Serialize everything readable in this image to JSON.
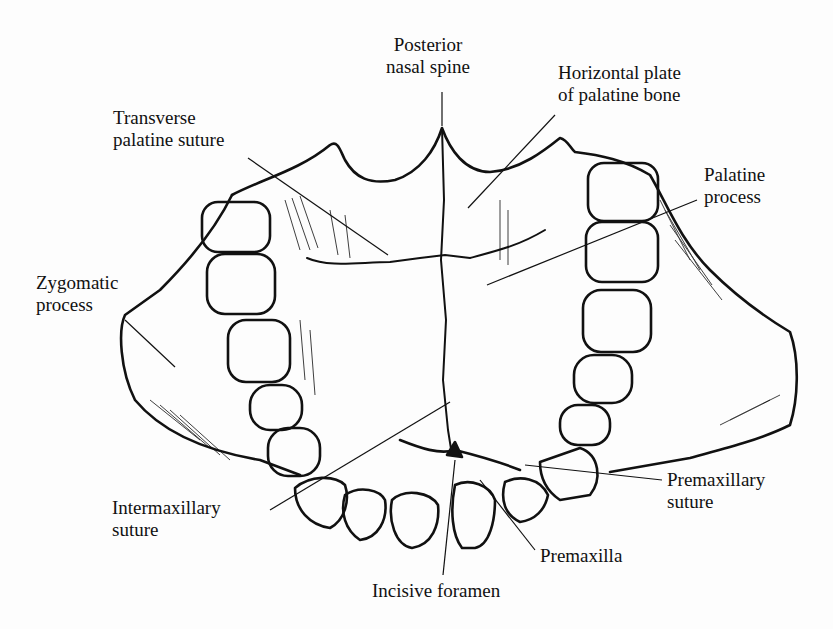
{
  "figure": {
    "labels": {
      "posterior_nasal_spine": [
        "Posterior",
        "nasal spine"
      ],
      "horizontal_plate": [
        "Horizontal plate",
        "of palatine bone"
      ],
      "transverse_palatine_suture": [
        "Transverse",
        "palatine suture"
      ],
      "palatine_process": [
        "Palatine",
        "process"
      ],
      "zygomatic_process": [
        "Zygomatic",
        "process"
      ],
      "intermaxillary_suture": [
        "Intermaxillary",
        "suture"
      ],
      "premaxillary_suture": [
        "Premaxillary",
        "suture"
      ],
      "premaxilla": [
        "Premaxilla"
      ],
      "incisive_foramen": [
        "Incisive foramen"
      ]
    },
    "colors": {
      "ink": "#111111",
      "paper": "#fdfdfd"
    }
  }
}
